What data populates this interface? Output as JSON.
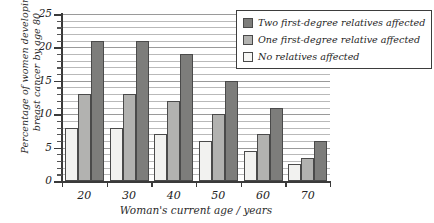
{
  "chart_data": {
    "type": "bar",
    "title": "",
    "xlabel": "Woman's current age / years",
    "ylabel_line1": "Percentage of women developing",
    "ylabel_line2": "breast cancer by age 80",
    "categories": [
      "20",
      "30",
      "40",
      "50",
      "60",
      "70"
    ],
    "ylim": [
      0,
      25
    ],
    "yticks": [
      "0",
      "5",
      "10",
      "15",
      "20",
      "25"
    ],
    "grid": "horizontal gridlines every 1 unit",
    "legend_position": "top-right inside boxed frame",
    "series": [
      {
        "name": "No relatives affected",
        "key": "s0",
        "color": "#f2f2f0",
        "values": [
          8,
          8,
          7,
          6,
          4.5,
          2.5
        ]
      },
      {
        "name": "One first-degree relative affected",
        "key": "s1",
        "color": "#b2b2b0",
        "values": [
          13,
          13,
          12,
          10,
          7,
          3.5
        ]
      },
      {
        "name": "Two first-degree relatives affected",
        "key": "s2",
        "color": "#7d7d7b",
        "values": [
          21,
          21,
          19,
          15,
          11,
          6
        ]
      }
    ],
    "legend_order": [
      "Two first-degree relatives affected",
      "One first-degree relative affected",
      "No relatives affected"
    ]
  }
}
